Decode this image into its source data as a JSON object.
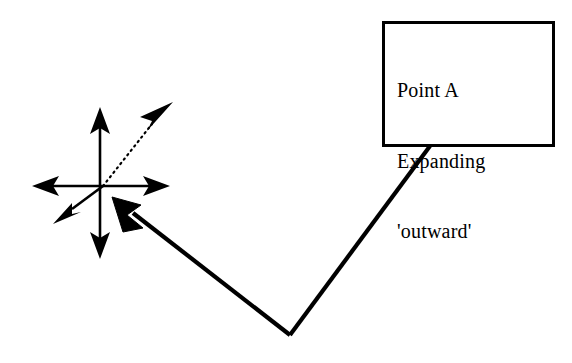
{
  "figure": {
    "background_color": "#ffffff",
    "ink_color": "#000000",
    "width": 572,
    "height": 363
  },
  "callout": {
    "name": "Point A callout box",
    "border_color": "#000000",
    "fill_color": "#ffffff",
    "lines": [
      "Point A",
      "Expanding",
      "'outward'"
    ]
  },
  "leader": {
    "name": "leader line from callout to point A",
    "stroke_color": "#000000",
    "stroke_width": 4,
    "points": "430,146 290,335 115,200",
    "arrowhead": "filled-triangle-at-point-a"
  },
  "point_a": {
    "name": "Point A expansion star",
    "center_x": 103,
    "center_y": 186,
    "stroke_color": "#000000",
    "stroke_width": 2.4,
    "arrows": [
      {
        "label": "up",
        "style": "solid",
        "tip_x": 100,
        "tip_y": 108
      },
      {
        "label": "down",
        "style": "solid",
        "tip_x": 100,
        "tip_y": 258
      },
      {
        "label": "left",
        "style": "solid",
        "tip_x": 33,
        "tip_y": 186
      },
      {
        "label": "right",
        "style": "solid",
        "tip_x": 169,
        "tip_y": 186
      },
      {
        "label": "down-left",
        "style": "solid",
        "tip_x": 54,
        "tip_y": 223
      },
      {
        "label": "up-right",
        "style": "dotted",
        "tip_x": 172,
        "tip_y": 103
      }
    ]
  }
}
